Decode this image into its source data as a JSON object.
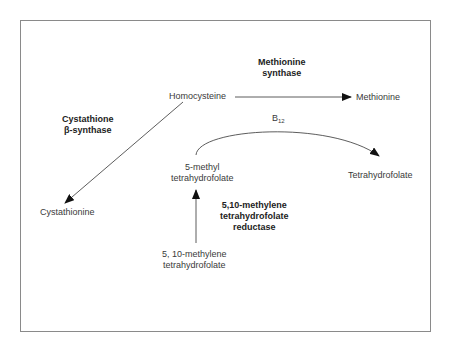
{
  "diagram": {
    "nodes": {
      "homocysteine": "Homocysteine",
      "methionine": "Methionine",
      "cystathionine": "Cystathionine",
      "methyl_thf": [
        "5-methyl",
        "tetrahydrofolate"
      ],
      "thf": "Tetrahydrofolate",
      "methylene_thf": [
        "5, 10-methylene",
        "tetrahydrofolate"
      ]
    },
    "enzymes": {
      "methionine_synthase": [
        "Methionine",
        "synthase"
      ],
      "cystathionine_synthase": [
        "Cystathione",
        "β-synthase"
      ],
      "mthfr": [
        "5,10-methylene",
        "tetrahydrofolate",
        "reductase"
      ]
    },
    "cofactor": {
      "base": "B",
      "subscript": "12"
    },
    "edges": [
      {
        "from": "Homocysteine",
        "to": "Methionine",
        "enzyme": "Methionine synthase"
      },
      {
        "from": "Homocysteine",
        "to": "Cystathionine",
        "enzyme": "Cystathione β-synthase"
      },
      {
        "from": "5-methyl tetrahydrofolate",
        "to": "Tetrahydrofolate",
        "cofactor": "B12"
      },
      {
        "from": "5, 10-methylene tetrahydrofolate",
        "to": "5-methyl tetrahydrofolate",
        "enzyme": "5,10-methylene tetrahydrofolate reductase"
      }
    ]
  }
}
